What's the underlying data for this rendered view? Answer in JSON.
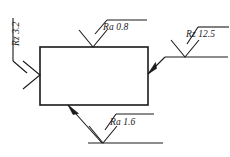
{
  "drawing": {
    "title": "Surface roughness symbols on rectangular part",
    "stroke_color": "#1a1a1a",
    "background_color": "#ffffff",
    "part": {
      "shape": "rectangle",
      "x": 40,
      "y": 47,
      "width": 108,
      "height": 58
    },
    "annotations": [
      {
        "id": "top",
        "label": "Ra 0.8",
        "parameter": "Ra",
        "value": "0.8",
        "surface": "top",
        "symbol": "surface-roughness-triangle",
        "has_leader": false
      },
      {
        "id": "right",
        "label": "Rz 12.5",
        "parameter": "Rz",
        "value": "12.5",
        "surface": "right",
        "symbol": "surface-roughness-triangle",
        "has_leader": true
      },
      {
        "id": "bottom",
        "label": "Ra 1.6",
        "parameter": "Ra",
        "value": "1.6",
        "surface": "bottom",
        "symbol": "surface-roughness-triangle",
        "has_leader": true
      },
      {
        "id": "left",
        "label": "Rz 3.2",
        "parameter": "Rz",
        "value": "3.2",
        "surface": "left",
        "symbol": "surface-roughness-triangle-rotated",
        "has_leader": false,
        "rotated": true
      }
    ]
  }
}
